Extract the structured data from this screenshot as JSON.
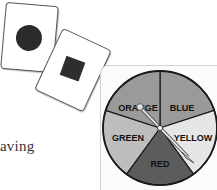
{
  "cards": [
    {
      "shape": "circle",
      "color": "#2b2b2b"
    },
    {
      "shape": "square",
      "color": "#2e2e2e"
    }
  ],
  "text_fragment": "aving",
  "spinner": {
    "sections": [
      {
        "label": "ORANGE",
        "color": "#9a9a9a"
      },
      {
        "label": "BLUE",
        "color": "#9a9a9a"
      },
      {
        "label": "YELLOW",
        "color": "#e6e6e6"
      },
      {
        "label": "RED",
        "color": "#5c5c5c"
      },
      {
        "label": "GREEN",
        "color": "#bdbdbd"
      }
    ],
    "pointer_target": "YELLOW"
  }
}
